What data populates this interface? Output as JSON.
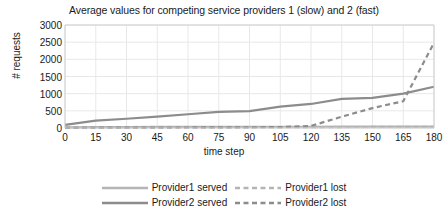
{
  "chart_data": {
    "type": "line",
    "title": "Average values for competing service providers 1 (slow) and 2 (fast)",
    "xlabel": "time step",
    "ylabel": "# requests",
    "xlim": [
      0,
      180
    ],
    "ylim": [
      0,
      3000
    ],
    "grid": true,
    "legend_position": "bottom",
    "xticks": [
      0,
      15,
      30,
      45,
      60,
      75,
      90,
      105,
      120,
      135,
      150,
      165,
      180
    ],
    "yticks": [
      0,
      500,
      1000,
      1500,
      2000,
      2500,
      3000
    ],
    "x": [
      0,
      15,
      30,
      45,
      60,
      75,
      90,
      105,
      120,
      135,
      150,
      165,
      180
    ],
    "series": [
      {
        "name": "Provider1 served",
        "style": "solid",
        "color": "#b4b4b4",
        "values": [
          20,
          25,
          28,
          30,
          32,
          34,
          35,
          36,
          37,
          38,
          39,
          40,
          40
        ]
      },
      {
        "name": "Provider1 lost",
        "style": "dashed",
        "color": "#b4b4b4",
        "values": [
          10,
          12,
          14,
          16,
          18,
          20,
          22,
          24,
          26,
          28,
          30,
          32,
          34
        ]
      },
      {
        "name": "Provider2 served",
        "style": "solid",
        "color": "#8c8c8c",
        "values": [
          90,
          215,
          270,
          330,
          400,
          470,
          490,
          620,
          700,
          850,
          880,
          1000,
          1200
        ]
      },
      {
        "name": "Provider2 lost",
        "style": "dashed",
        "color": "#8c8c8c",
        "values": [
          5,
          8,
          10,
          12,
          15,
          18,
          20,
          25,
          60,
          330,
          580,
          780,
          2480
        ]
      }
    ]
  },
  "legend": {
    "rows": [
      [
        {
          "label": "Provider1 served",
          "style": "solid",
          "color": "#b4b4b4"
        },
        {
          "label": "Provider1 lost",
          "style": "dashed",
          "color": "#b4b4b4"
        }
      ],
      [
        {
          "label": "Provider2 served",
          "style": "solid",
          "color": "#8c8c8c"
        },
        {
          "label": "Provider2 lost",
          "style": "dashed",
          "color": "#8c8c8c"
        }
      ]
    ]
  },
  "colors": {
    "grid": "#e8e8e8",
    "axis": "#d0d0d0",
    "text": "#1a1a1a",
    "background": "#ffffff"
  }
}
